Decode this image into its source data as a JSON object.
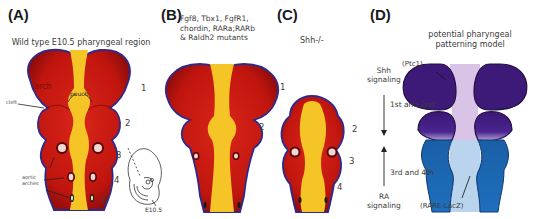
{
  "figure": {
    "panels": [
      {
        "letter": "(A)",
        "title": "Wild type E10.5 pharyngeal region",
        "labels": {
          "arch": "arch",
          "pouch": "pouch",
          "cleft": "cleft",
          "aortic_arches": "aortic arches",
          "embryo_stage": "E10.5"
        },
        "arch_numbers": [
          "1",
          "2",
          "3",
          "4",
          "6"
        ]
      },
      {
        "letter": "(B)",
        "title_lines": [
          "Fgf8, Tbx1, FgfR1,",
          "chordin, RARa;RARb",
          "& Raldh2 mutants"
        ],
        "arch_numbers": [
          "1",
          "2"
        ]
      },
      {
        "letter": "(C)",
        "title": "Shh-/-",
        "arch_numbers": [
          "2",
          "3",
          "4"
        ]
      },
      {
        "letter": "(D)",
        "title_lines": [
          "potential pharyngeal",
          "patterning model"
        ],
        "shh_label_lines": [
          "Shh",
          "signaling"
        ],
        "first_second": "1st and 2nd",
        "third_fourth": "3rd and 4th",
        "ra_label_lines": [
          "RA",
          "signaling"
        ],
        "ptc1": "(Ptc1)",
        "rare_lacz": "(RARE-LacZ)"
      }
    ],
    "colors": {
      "arch_red": "#c8190f",
      "arch_dark_red": "#8e0c0a",
      "endoderm_yellow": "#f5c427",
      "outline_blue": "#2e2a8a",
      "shh_purple": "#3d1a78",
      "shh_light": "#d9c3e6",
      "ra_blue": "#1e6bb5",
      "ra_light": "#b9d4ec"
    }
  }
}
